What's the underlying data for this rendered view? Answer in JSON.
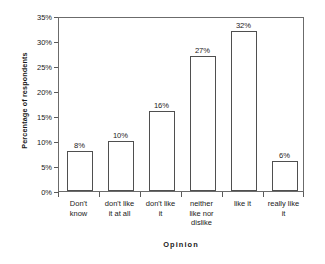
{
  "chart_data": {
    "type": "bar",
    "title": "",
    "xlabel": "Opinion",
    "ylabel": "Percentage of respondents",
    "categories": [
      "Don't know",
      "don't like it at all",
      "don't like it",
      "neither like nor dislike",
      "like it",
      "really like it"
    ],
    "category_lines": [
      [
        "Don't",
        "know"
      ],
      [
        "don't like",
        "it at all"
      ],
      [
        "don't like",
        "it"
      ],
      [
        "neither",
        "like nor",
        "dislike"
      ],
      [
        "like it"
      ],
      [
        "really like",
        "it"
      ]
    ],
    "values": [
      8,
      10,
      16,
      27,
      32,
      6
    ],
    "value_labels": [
      "8%",
      "10%",
      "16%",
      "27%",
      "32%",
      "6%"
    ],
    "ylim": [
      0,
      35
    ],
    "ytick_values": [
      0,
      5,
      10,
      15,
      20,
      25,
      30,
      35
    ],
    "ytick_labels": [
      "0%",
      "5%",
      "10%",
      "15%",
      "20%",
      "25%",
      "30%",
      "35%"
    ],
    "grid": false,
    "legend": false,
    "bar_fill_color": "#ffffff",
    "bar_edge_color": "#4f4f4f",
    "plot_border_color": "#6b6b6b",
    "background_color": "#ffffff",
    "text_color": "#1a1a1a"
  }
}
